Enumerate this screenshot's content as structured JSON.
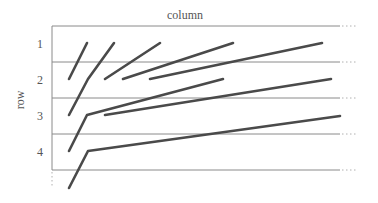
{
  "title": "column",
  "ylabel": "row",
  "rows": [
    "1",
    "2",
    "3",
    "4"
  ],
  "colors": {
    "grid": "#8a8a8a",
    "segment": "#4a4a4a",
    "text": "#555555"
  },
  "grid": {
    "left": 52,
    "right": 340,
    "dotted_end": 358,
    "y": [
      26,
      62,
      98,
      134,
      170
    ],
    "axis_dotted_bottom": 188
  },
  "segments": [
    {
      "points": [
        [
          87,
          43
        ],
        [
          69,
          79
        ]
      ]
    },
    {
      "points": [
        [
          114,
          43
        ],
        [
          88,
          79
        ],
        [
          69,
          115
        ]
      ]
    },
    {
      "points": [
        [
          160,
          43
        ],
        [
          105,
          79
        ]
      ]
    },
    {
      "points": [
        [
          233,
          43
        ],
        [
          123,
          79
        ]
      ]
    },
    {
      "points": [
        [
          322,
          43
        ],
        [
          150,
          79
        ]
      ]
    },
    {
      "points": [
        [
          223,
          79
        ],
        [
          87,
          115
        ],
        [
          69,
          151
        ]
      ]
    },
    {
      "points": [
        [
          331,
          79
        ],
        [
          105,
          115
        ]
      ]
    },
    {
      "points": [
        [
          340,
          116
        ],
        [
          88,
          151
        ],
        [
          69,
          188
        ]
      ]
    }
  ]
}
